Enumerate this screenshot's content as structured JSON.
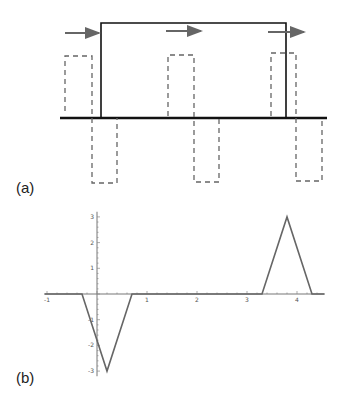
{
  "panel_a": {
    "label": "(a)",
    "description": "Rectangular solid pulse over baseline with three dashed bipolar pulses and arrows indicating propagation",
    "colors": {
      "solid": "#111111",
      "dashed": "#666666",
      "arrow": "#666666",
      "baseline": "#111111"
    }
  },
  "panel_b": {
    "label": "(b)",
    "x_ticks": [
      "-1",
      "1",
      "2",
      "3",
      "4"
    ],
    "y_ticks": [
      "3",
      "2",
      "1",
      "-1",
      "-2",
      "-3"
    ],
    "line_color": "#666666"
  },
  "chart_data": {
    "type": "line",
    "title": "",
    "xlabel": "",
    "ylabel": "",
    "xlim": [
      -1.05,
      4.55
    ],
    "ylim": [
      -3.2,
      3.2
    ],
    "grid": false,
    "x_ticks": [
      -1,
      1,
      2,
      3,
      4
    ],
    "y_ticks": [
      -3,
      -2,
      -1,
      1,
      2,
      3
    ],
    "series": [
      {
        "name": "signal",
        "x": [
          -1.05,
          -0.3,
          0.2,
          0.7,
          3.3,
          3.8,
          4.3,
          4.55
        ],
        "y": [
          0,
          0,
          -3,
          0,
          0,
          3,
          0,
          0
        ]
      }
    ]
  }
}
